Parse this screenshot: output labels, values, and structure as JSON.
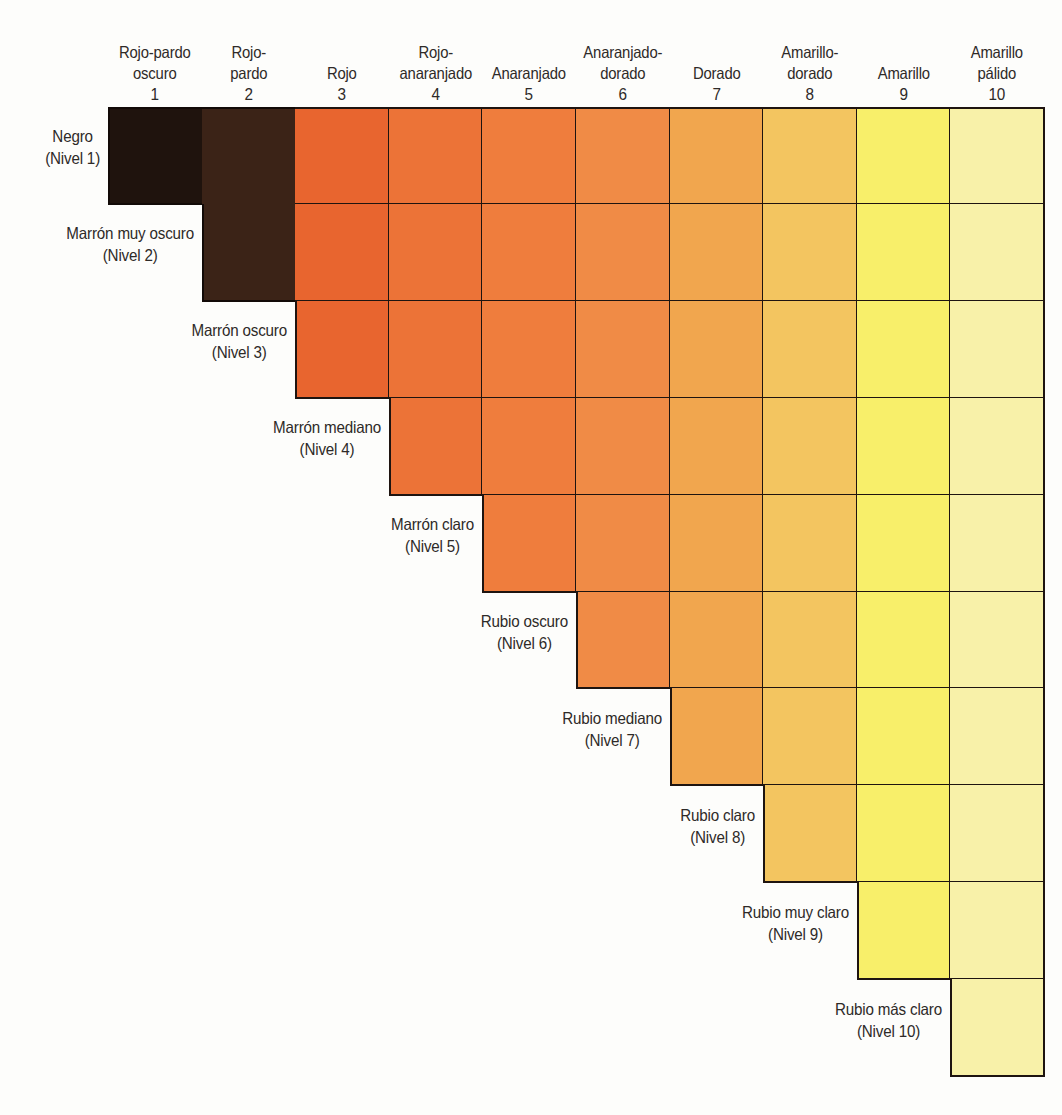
{
  "columns": [
    {
      "index": 1,
      "line1": "Rojo-pardo",
      "line2": "oscuro",
      "number": "1",
      "color": "#1f130d"
    },
    {
      "index": 2,
      "line1": "Rojo-",
      "line2": "pardo",
      "number": "2",
      "color": "#3b2317"
    },
    {
      "index": 3,
      "line1": "",
      "line2": "Rojo",
      "number": "3",
      "color": "#e8652f"
    },
    {
      "index": 4,
      "line1": "Rojo-",
      "line2": "anaranjado",
      "number": "4",
      "color": "#ec7337"
    },
    {
      "index": 5,
      "line1": "",
      "line2": "Anaranjado",
      "number": "5",
      "color": "#ef7d3d"
    },
    {
      "index": 6,
      "line1": "Anaranjado-",
      "line2": "dorado",
      "number": "6",
      "color": "#f08b46"
    },
    {
      "index": 7,
      "line1": "",
      "line2": "Dorado",
      "number": "7",
      "color": "#f1a64e"
    },
    {
      "index": 8,
      "line1": "Amarillo-",
      "line2": "dorado",
      "number": "8",
      "color": "#f3c560"
    },
    {
      "index": 9,
      "line1": "",
      "line2": "Amarillo",
      "number": "9",
      "color": "#f8ef6a"
    },
    {
      "index": 10,
      "line1": "Amarillo",
      "line2": "pálido",
      "number": "10",
      "color": "#f8f1a9"
    }
  ],
  "rows": [
    {
      "level": 1,
      "name": "Negro",
      "label": "(Nivel 1)"
    },
    {
      "level": 2,
      "name": "Marrón muy oscuro",
      "label": "(Nivel 2)"
    },
    {
      "level": 3,
      "name": "Marrón oscuro",
      "label": "(Nivel 3)"
    },
    {
      "level": 4,
      "name": "Marrón mediano",
      "label": "(Nivel 4)"
    },
    {
      "level": 5,
      "name": "Marrón claro",
      "label": "(Nivel 5)"
    },
    {
      "level": 6,
      "name": "Rubio oscuro",
      "label": "(Nivel 6)"
    },
    {
      "level": 7,
      "name": "Rubio mediano",
      "label": "(Nivel 7)"
    },
    {
      "level": 8,
      "name": "Rubio claro",
      "label": "(Nivel 8)"
    },
    {
      "level": 9,
      "name": "Rubio muy claro",
      "label": "(Nivel 9)"
    },
    {
      "level": 10,
      "name": "Rubio más claro",
      "label": "(Nivel 10)"
    }
  ],
  "chart_data": {
    "type": "heatmap",
    "title": "",
    "xlabel": "Pigmento subyacente (columnas 1–10)",
    "ylabel": "Nivel natural del cabello (filas 1–10)",
    "x": [
      "Rojo-pardo oscuro 1",
      "Rojo-pardo 2",
      "Rojo 3",
      "Rojo-anaranjado 4",
      "Anaranjado 5",
      "Anaranjado-dorado 6",
      "Dorado 7",
      "Amarillo-dorado 8",
      "Amarillo 9",
      "Amarillo pálido 10"
    ],
    "y": [
      "Negro (Nivel 1)",
      "Marrón muy oscuro (Nivel 2)",
      "Marrón oscuro (Nivel 3)",
      "Marrón mediano (Nivel 4)",
      "Marrón claro (Nivel 5)",
      "Rubio oscuro (Nivel 6)",
      "Rubio mediano (Nivel 7)",
      "Rubio claro (Nivel 8)",
      "Rubio muy claro (Nivel 9)",
      "Rubio más claro (Nivel 10)"
    ],
    "structure": "Upper-triangular staircase: row N contains filled cells in columns N through 10; colors are by column.",
    "cells_per_row": [
      10,
      9,
      8,
      7,
      6,
      5,
      4,
      3,
      2,
      1
    ],
    "column_colors": [
      "#1f130d",
      "#3b2317",
      "#e8652f",
      "#ec7337",
      "#ef7d3d",
      "#f08b46",
      "#f1a64e",
      "#f3c560",
      "#f8ef6a",
      "#f8f1a9"
    ],
    "grid": true,
    "legend": "none"
  },
  "layout": {
    "grid_left": 108,
    "grid_top": 107,
    "col_width": 93.6,
    "row_height": 96.9
  }
}
